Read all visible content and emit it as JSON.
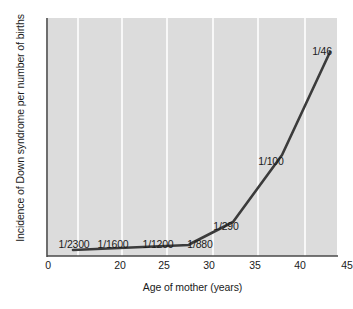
{
  "chart_data": {
    "type": "line",
    "title": "",
    "xlabel": "Age of mother (years)",
    "ylabel": "Incidence of Down syndrome per number of births",
    "xlim": [
      0,
      49
    ],
    "ylim": [
      0,
      1
    ],
    "grid": true,
    "legend": false,
    "xticks": [
      {
        "value": 0,
        "label": "0",
        "px": 6
      },
      {
        "value": 20,
        "label": "20",
        "px": 78
      },
      {
        "value": 25,
        "label": "25",
        "px": 122
      },
      {
        "value": 30,
        "label": "30",
        "px": 167
      },
      {
        "value": 35,
        "label": "35",
        "px": 213
      },
      {
        "value": 40,
        "label": "40",
        "px": 258
      },
      {
        "value": 45,
        "label": "45",
        "px": 305
      }
    ],
    "gridlines_px": [
      78,
      122,
      167,
      213,
      258,
      305
    ],
    "line_color": "#3b3b3b",
    "background_color": "#dcdcdc",
    "gridline_color": "#ffffff",
    "series": [
      {
        "name": "Incidence of Down syndrome",
        "points": [
          {
            "age": 20,
            "incidence_label": "1/2300",
            "incidence": 0.000435,
            "x_px": 25,
            "y_px": 232
          },
          {
            "age": 25,
            "incidence_label": "1/1600",
            "incidence": 0.000625,
            "x_px": 74,
            "y_px": 231
          },
          {
            "age": 30,
            "incidence_label": "1/1200",
            "incidence": 0.000833,
            "x_px": 119,
            "y_px": 229
          },
          {
            "age": 33,
            "incidence_label": "1/880",
            "incidence": 0.001136,
            "x_px": 141,
            "y_px": 227
          },
          {
            "age": 37,
            "incidence_label": "1/290",
            "incidence": 0.003448,
            "x_px": 185,
            "y_px": 204
          },
          {
            "age": 42,
            "incidence_label": "1/100",
            "incidence": 0.01,
            "x_px": 234,
            "y_px": 137
          },
          {
            "age": 47,
            "incidence_label": "1/46",
            "incidence": 0.021739,
            "x_px": 282,
            "y_px": 34
          }
        ],
        "path_px": "M 25 232 L 141 227 L 142 226 L 185 204 L 234 137 L 282 34"
      }
    ],
    "annotations": [
      {
        "text": "1/2300",
        "x_px": 74,
        "y_px": 238
      },
      {
        "text": "1/1600",
        "x_px": 113,
        "y_px": 238
      },
      {
        "text": "1/1200",
        "x_px": 158,
        "y_px": 238
      },
      {
        "text": "1/880",
        "x_px": 200,
        "y_px": 238
      },
      {
        "text": "1/290",
        "x_px": 226,
        "y_px": 220
      },
      {
        "text": "1/100",
        "x_px": 271,
        "y_px": 155
      },
      {
        "text": "1/46",
        "x_px": 322,
        "y_px": 45
      }
    ]
  }
}
